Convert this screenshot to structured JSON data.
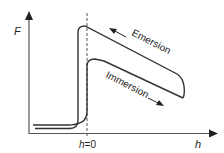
{
  "diagram": {
    "y_axis_label": "F",
    "x_axis_label": "h",
    "origin_marker_label": "h=0",
    "curves": [
      {
        "name": "Emersion",
        "direction": "leftward",
        "label": "Emersion"
      },
      {
        "name": "Immersion",
        "direction": "rightward",
        "label": "Immersion"
      }
    ],
    "colors": {
      "line": "#333333",
      "dashed": "#555555",
      "text": "#222222"
    }
  }
}
